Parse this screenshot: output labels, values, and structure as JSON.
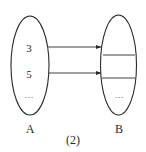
{
  "diagram": {
    "type": "set-mapping",
    "caption": "(2)",
    "set_a": {
      "label": "A",
      "elements": [
        "3",
        "5",
        "..."
      ]
    },
    "set_b": {
      "label": "B",
      "elements": [
        "",
        "",
        "..."
      ]
    },
    "arrows": [
      {
        "from": "3",
        "to": "B slot 1"
      },
      {
        "from": "5",
        "to": "B slot 2"
      }
    ],
    "colors": {
      "stroke": "#2a2a2a",
      "background": "#ffffff"
    }
  }
}
